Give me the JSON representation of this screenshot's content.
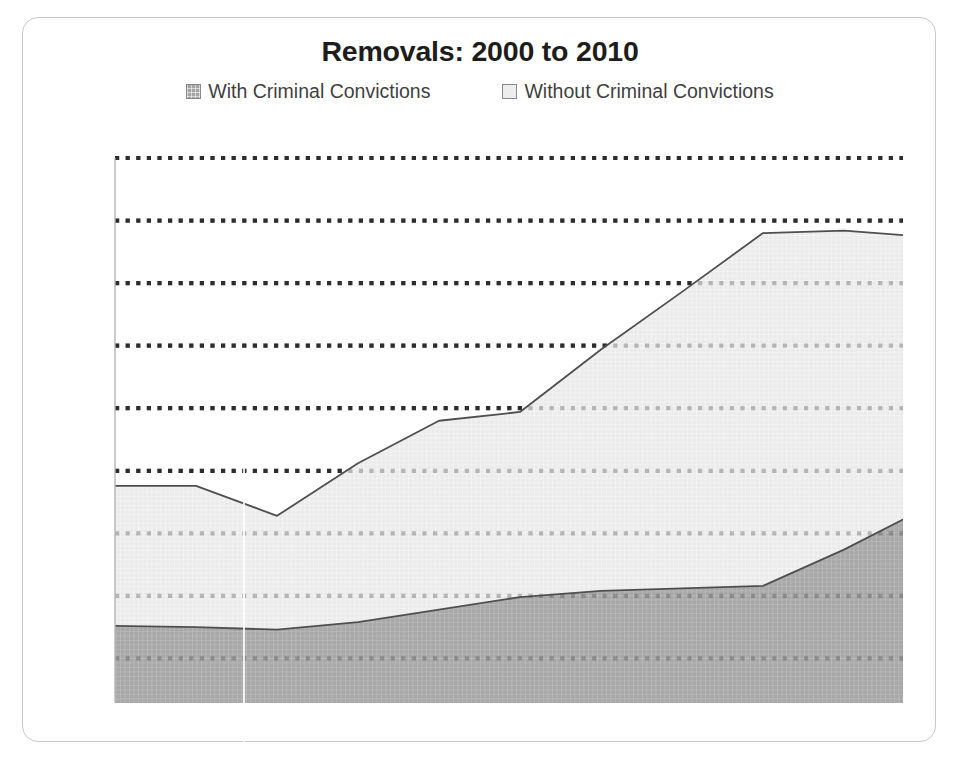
{
  "card": {
    "title": "Removals: 2000 to 2010"
  },
  "legend": [
    {
      "label": "With Criminal Convictions",
      "swatch": "dark",
      "color": "#a5a5a5",
      "icon": "legend-swatch-filled-icon"
    },
    {
      "label": "Without Criminal Convictions",
      "swatch": "light",
      "color": "#ededed",
      "icon": "legend-swatch-hollow-icon"
    }
  ],
  "chart_data": {
    "type": "area",
    "stacked": true,
    "title": "Removals: 2000 to 2010",
    "xlabel": "",
    "ylabel": "",
    "x": [
      2000,
      2001,
      2002,
      2003,
      2004,
      2005,
      2006,
      2007,
      2008,
      2009,
      2010
    ],
    "categories": [
      "2000",
      "2001",
      "2002",
      "2003",
      "2004",
      "2005",
      "2006",
      "2007",
      "2008",
      "2009",
      "2010"
    ],
    "series": [
      {
        "name": "With Criminal Convictions",
        "color": "#a5a5a5",
        "values": [
          76000,
          75000,
          73000,
          79000,
          89000,
          99000,
          104000,
          106000,
          108000,
          137000,
          170000
        ]
      },
      {
        "name": "Without Criminal Convictions",
        "color": "#ededed",
        "values": [
          112000,
          113000,
          91000,
          127000,
          151000,
          148000,
          193000,
          237000,
          282000,
          255000,
          217000
        ]
      }
    ],
    "totals": [
      188000,
      188000,
      164000,
      206000,
      240000,
      247000,
      297000,
      343000,
      390000,
      392000,
      387000
    ],
    "ylim": [
      0,
      450000
    ],
    "yticks": [
      0,
      50000,
      100000,
      150000,
      200000,
      250000,
      300000,
      350000,
      400000,
      450000
    ],
    "ytick_labels": [],
    "xtick_labels": [],
    "grid": "horizontal-dotted",
    "grid_color": "#2b2b2b",
    "legend_position": "top"
  }
}
